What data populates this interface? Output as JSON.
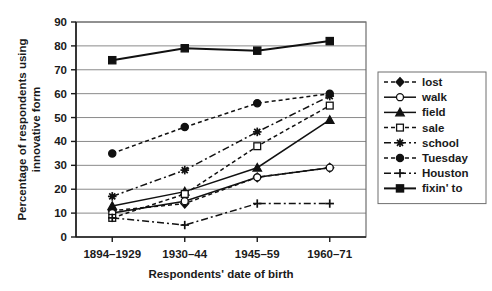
{
  "chart_data": {
    "type": "line",
    "title": "",
    "xlabel": "Respondents' date of birth",
    "ylabel": "Percentage of respondents using innovative form",
    "categories": [
      "1894–1929",
      "1930–44",
      "1945–59",
      "1960–71"
    ],
    "ylim": [
      0,
      90
    ],
    "ytick_step": 10,
    "yticks": [
      "0",
      "10",
      "20",
      "30",
      "40",
      "50",
      "60",
      "70",
      "80",
      "90"
    ],
    "grid": true,
    "legend_position": "right",
    "series": [
      {
        "name": "lost",
        "marker": "diamond-filled",
        "dash": "dashed",
        "values": [
          11,
          14,
          25,
          29
        ]
      },
      {
        "name": "walk",
        "marker": "circle-open",
        "dash": "solid",
        "values": [
          10,
          15,
          25,
          29
        ]
      },
      {
        "name": "field",
        "marker": "triangle-filled",
        "dash": "solid",
        "values": [
          13,
          19,
          29,
          49
        ]
      },
      {
        "name": "sale",
        "marker": "square-open",
        "dash": "dashed",
        "values": [
          8,
          18,
          38,
          55
        ]
      },
      {
        "name": "school",
        "marker": "star-filled",
        "dash": "dashdot",
        "values": [
          17,
          28,
          44,
          59
        ]
      },
      {
        "name": "Tuesday",
        "marker": "circle-filled",
        "dash": "dashed",
        "values": [
          35,
          46,
          56,
          60
        ]
      },
      {
        "name": "Houston",
        "marker": "plus",
        "dash": "dashdot",
        "values": [
          8,
          5,
          14,
          14
        ]
      },
      {
        "name": "fixin' to",
        "marker": "square-filled",
        "dash": "solid",
        "values": [
          74,
          79,
          78,
          82
        ]
      }
    ]
  }
}
